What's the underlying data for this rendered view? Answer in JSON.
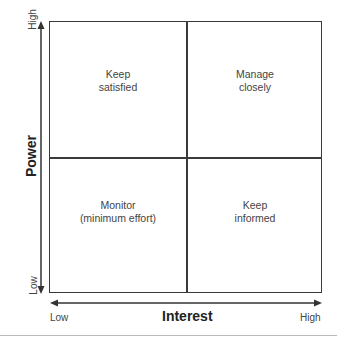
{
  "diagram": {
    "type": "2x2 matrix",
    "y_axis": {
      "title": "Power",
      "low_label": "Low",
      "high_label": "High"
    },
    "x_axis": {
      "title": "Interest",
      "low_label": "Low",
      "high_label": "High"
    },
    "quadrants": {
      "top_left": {
        "line1": "Keep",
        "line2": "satisfied"
      },
      "top_right": {
        "line1": "Manage",
        "line2": "closely"
      },
      "bottom_left": {
        "line1": "Monitor",
        "line2": "(minimum effort)"
      },
      "bottom_right": {
        "line1": "Keep",
        "line2": "informed"
      }
    },
    "line_color": "#3a3a3a"
  }
}
